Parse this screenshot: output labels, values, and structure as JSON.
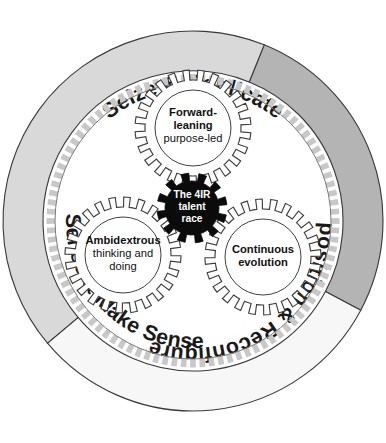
{
  "diagram": {
    "type": "concentric-gear-wheel",
    "canvas": {
      "width": 386,
      "height": 443
    }
  },
  "outer_ring": {
    "segments": [
      {
        "id": "seize-replicate",
        "label": "Seize & Replicate",
        "color": "#b4b4b4",
        "position": "top-right",
        "start_angle_deg": -68,
        "end_angle_deg": 28,
        "text_flipped": false
      },
      {
        "id": "reposition-reconfigure",
        "label": "Reposition & Reconfigure",
        "color": "#f7f7f7",
        "position": "bottom-right",
        "start_angle_deg": 28,
        "end_angle_deg": 140,
        "text_flipped": true
      },
      {
        "id": "sense-make-sense",
        "label": "Sense & Make Sense",
        "color": "#d9d9d9",
        "position": "left",
        "start_angle_deg": 140,
        "end_angle_deg": 292,
        "text_flipped": false
      }
    ]
  },
  "gears": [
    {
      "id": "forward-leaning",
      "position": "top",
      "lines": [
        {
          "text": "Forward-",
          "weight": "bold"
        },
        {
          "text": "leaning",
          "weight": "bold"
        },
        {
          "text": "purpose-led",
          "weight": "regular"
        }
      ],
      "fill": "#ffffff",
      "teeth": 24
    },
    {
      "id": "ambidextrous",
      "position": "bottom-left",
      "lines": [
        {
          "text": "Ambidextrous",
          "weight": "bold"
        },
        {
          "text": "thinking and",
          "weight": "regular"
        },
        {
          "text": "doing",
          "weight": "regular"
        }
      ],
      "fill": "#ffffff",
      "teeth": 24
    },
    {
      "id": "continuous-evolution",
      "position": "bottom-right",
      "lines": [
        {
          "text": "Continuous",
          "weight": "bold"
        },
        {
          "text": "evolution",
          "weight": "bold"
        }
      ],
      "fill": "#ffffff",
      "teeth": 24
    }
  ],
  "center_gear": {
    "id": "the-4ir-talent-race",
    "lines": [
      {
        "text": "The 4IR"
      },
      {
        "text": "talent"
      },
      {
        "text": "race"
      }
    ],
    "fill": "#0b0b0b",
    "text_color": "#ffffff",
    "teeth": 12
  },
  "inner_ring": {
    "id": "toothed-inner-ring",
    "tick_count": 96,
    "tick_color": "#c8c8c8",
    "outline_color": "#7a7a7a"
  },
  "colors": {
    "background": "#ffffff",
    "outline": "#3f3f3f",
    "dark_gray": "#b4b4b4",
    "mid_gray": "#d9d9d9",
    "near_white": "#f7f7f7",
    "black": "#0b0b0b"
  }
}
